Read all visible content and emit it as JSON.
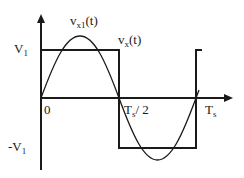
{
  "diagram": {
    "type": "waveform",
    "labels": {
      "v_pos": {
        "main": "V",
        "sub": "1"
      },
      "v_neg": {
        "main": "-V",
        "sub": "1"
      },
      "origin": "0",
      "half_period": {
        "main": "T",
        "sub": "s",
        "tail": "/ 2"
      },
      "period": {
        "main": "T",
        "sub": "s"
      },
      "fundamental": {
        "main": "v",
        "sub": "x1",
        "tail": "(t)"
      },
      "square": {
        "main": "v",
        "sub": "x",
        "tail": "(t)"
      }
    },
    "colors": {
      "line": "#1a1a1a",
      "background": "#ffffff"
    }
  }
}
